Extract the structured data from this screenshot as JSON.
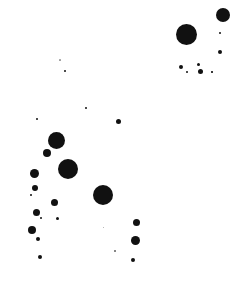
{
  "image": {
    "width": 248,
    "height": 287,
    "background": "#ffffff",
    "ink_color": "#111111",
    "description": "Scattered black ink dots / splatter on white background"
  },
  "dots": [
    {
      "x": 186,
      "y": 34,
      "r": 10.5
    },
    {
      "x": 223,
      "y": 15,
      "r": 7
    },
    {
      "x": 220,
      "y": 33,
      "r": 1
    },
    {
      "x": 220,
      "y": 52,
      "r": 2
    },
    {
      "x": 181,
      "y": 67,
      "r": 2
    },
    {
      "x": 187,
      "y": 72,
      "r": 1
    },
    {
      "x": 198,
      "y": 64,
      "r": 1.5
    },
    {
      "x": 200,
      "y": 71,
      "r": 2.5
    },
    {
      "x": 212,
      "y": 72,
      "r": 0.8
    },
    {
      "x": 60,
      "y": 60,
      "r": 0.6,
      "opacity": 0.4
    },
    {
      "x": 65,
      "y": 71,
      "r": 1
    },
    {
      "x": 86,
      "y": 108,
      "r": 1.2
    },
    {
      "x": 37,
      "y": 119,
      "r": 1
    },
    {
      "x": 118,
      "y": 121,
      "r": 2.5
    },
    {
      "x": 56,
      "y": 140,
      "r": 8.5
    },
    {
      "x": 47,
      "y": 153,
      "r": 4
    },
    {
      "x": 68,
      "y": 169,
      "r": 10
    },
    {
      "x": 34,
      "y": 173,
      "r": 4.5
    },
    {
      "x": 35,
      "y": 188,
      "r": 3
    },
    {
      "x": 31,
      "y": 195,
      "r": 1
    },
    {
      "x": 54,
      "y": 202,
      "r": 3.5
    },
    {
      "x": 103,
      "y": 195,
      "r": 10
    },
    {
      "x": 36,
      "y": 212,
      "r": 3.5
    },
    {
      "x": 41,
      "y": 218,
      "r": 1
    },
    {
      "x": 57,
      "y": 218,
      "r": 1.5
    },
    {
      "x": 32,
      "y": 230,
      "r": 4
    },
    {
      "x": 38,
      "y": 239,
      "r": 2
    },
    {
      "x": 40,
      "y": 257,
      "r": 2
    },
    {
      "x": 136,
      "y": 222,
      "r": 3.5
    },
    {
      "x": 135,
      "y": 240,
      "r": 4.5
    },
    {
      "x": 133,
      "y": 260,
      "r": 2
    },
    {
      "x": 115,
      "y": 251,
      "r": 0.7,
      "opacity": 0.6
    },
    {
      "x": 103,
      "y": 227,
      "r": 0.5,
      "opacity": 0.4
    }
  ]
}
